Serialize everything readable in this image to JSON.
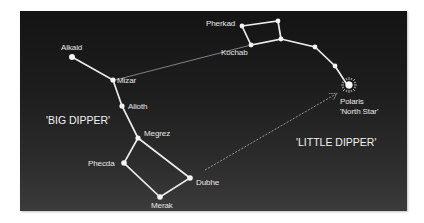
{
  "colors": {
    "background": "#ffffff",
    "sky_top": "#141414",
    "sky_bottom": "#3b3b3b",
    "star": "#f4f4f4",
    "line": "#eaeaea",
    "pointer_line": "#9a9a9a",
    "text": "#e8e8e8"
  },
  "constellations": {
    "big_dipper": {
      "label": "'BIG DIPPER'",
      "stars": [
        {
          "name": "Alkaid",
          "label": "Alkaid"
        },
        {
          "name": "Mizar",
          "label": "Mizar"
        },
        {
          "name": "Alioth",
          "label": "Alioth"
        },
        {
          "name": "Megrez",
          "label": "Megrez"
        },
        {
          "name": "Phecda",
          "label": "Phecda"
        },
        {
          "name": "Merak",
          "label": "Merak"
        },
        {
          "name": "Dubhe",
          "label": "Dubhe"
        }
      ]
    },
    "little_dipper": {
      "label": "'LITTLE DIPPER'",
      "stars": [
        {
          "name": "Pherkad",
          "label": "Pherkad"
        },
        {
          "name": "Kochab",
          "label": "Kochab"
        },
        {
          "name": "Polaris",
          "label": "Polaris",
          "sublabel": "'North Star'"
        }
      ]
    }
  },
  "annotations": {
    "pointer_line": "Dashed arrow from Dubhe pointing to Polaris",
    "connector_line": "Thin line from Mizar to Kochab"
  }
}
